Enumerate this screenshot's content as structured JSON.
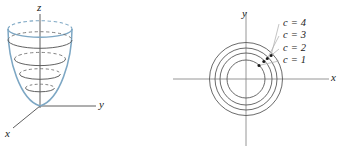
{
  "figure": {
    "background_color": "#ffffff",
    "surface_color": "#7da7c4",
    "axis_color": "#4d4d4d",
    "contour_color": "#595959",
    "leader_color": "#9a9a9a",
    "text_color": "#1a1a1a"
  },
  "left_panel": {
    "name": "paraboloid-surface-plot",
    "axes": {
      "z_label": "z",
      "y_label": "y",
      "x_label": "x"
    },
    "origin": {
      "x": 40,
      "y": 106
    },
    "surface": {
      "type": "elliptic-paraboloid",
      "half_width_top": 32,
      "height": 80,
      "ellipse_ry_ratio": 0.26
    },
    "level_curves": [
      {
        "level": 1,
        "rx": 14.5,
        "cy": 88
      },
      {
        "level": 2,
        "rx": 20.5,
        "cy": 74
      },
      {
        "level": 3,
        "rx": 25.5,
        "cy": 59
      },
      {
        "level": 4,
        "rx": 32.0,
        "cy": 40
      }
    ]
  },
  "right_panel": {
    "name": "level-curves-contour-map",
    "axes": {
      "y_label": "y",
      "x_label": "x"
    },
    "center": {
      "x": 75,
      "y": 79
    },
    "contours": [
      {
        "label": "c = 1",
        "radius": 19,
        "label_x": 113,
        "label_y": 59,
        "dot_x": 88.0,
        "dot_y": 65.4
      },
      {
        "label": "c = 2",
        "radius": 26,
        "label_x": 113,
        "label_y": 47,
        "dot_x": 92.8,
        "dot_y": 61.4
      },
      {
        "label": "c = 3",
        "radius": 31,
        "label_x": 113,
        "label_y": 34,
        "dot_x": 96.3,
        "dot_y": 58.5
      },
      {
        "label": "c = 4",
        "radius": 36.5,
        "label_x": 113,
        "label_y": 22,
        "dot_x": 100.1,
        "dot_y": 55.4
      }
    ],
    "axis_extent": {
      "x_min": 2,
      "x_max": 158,
      "y_min": 12,
      "y_max": 146
    }
  }
}
